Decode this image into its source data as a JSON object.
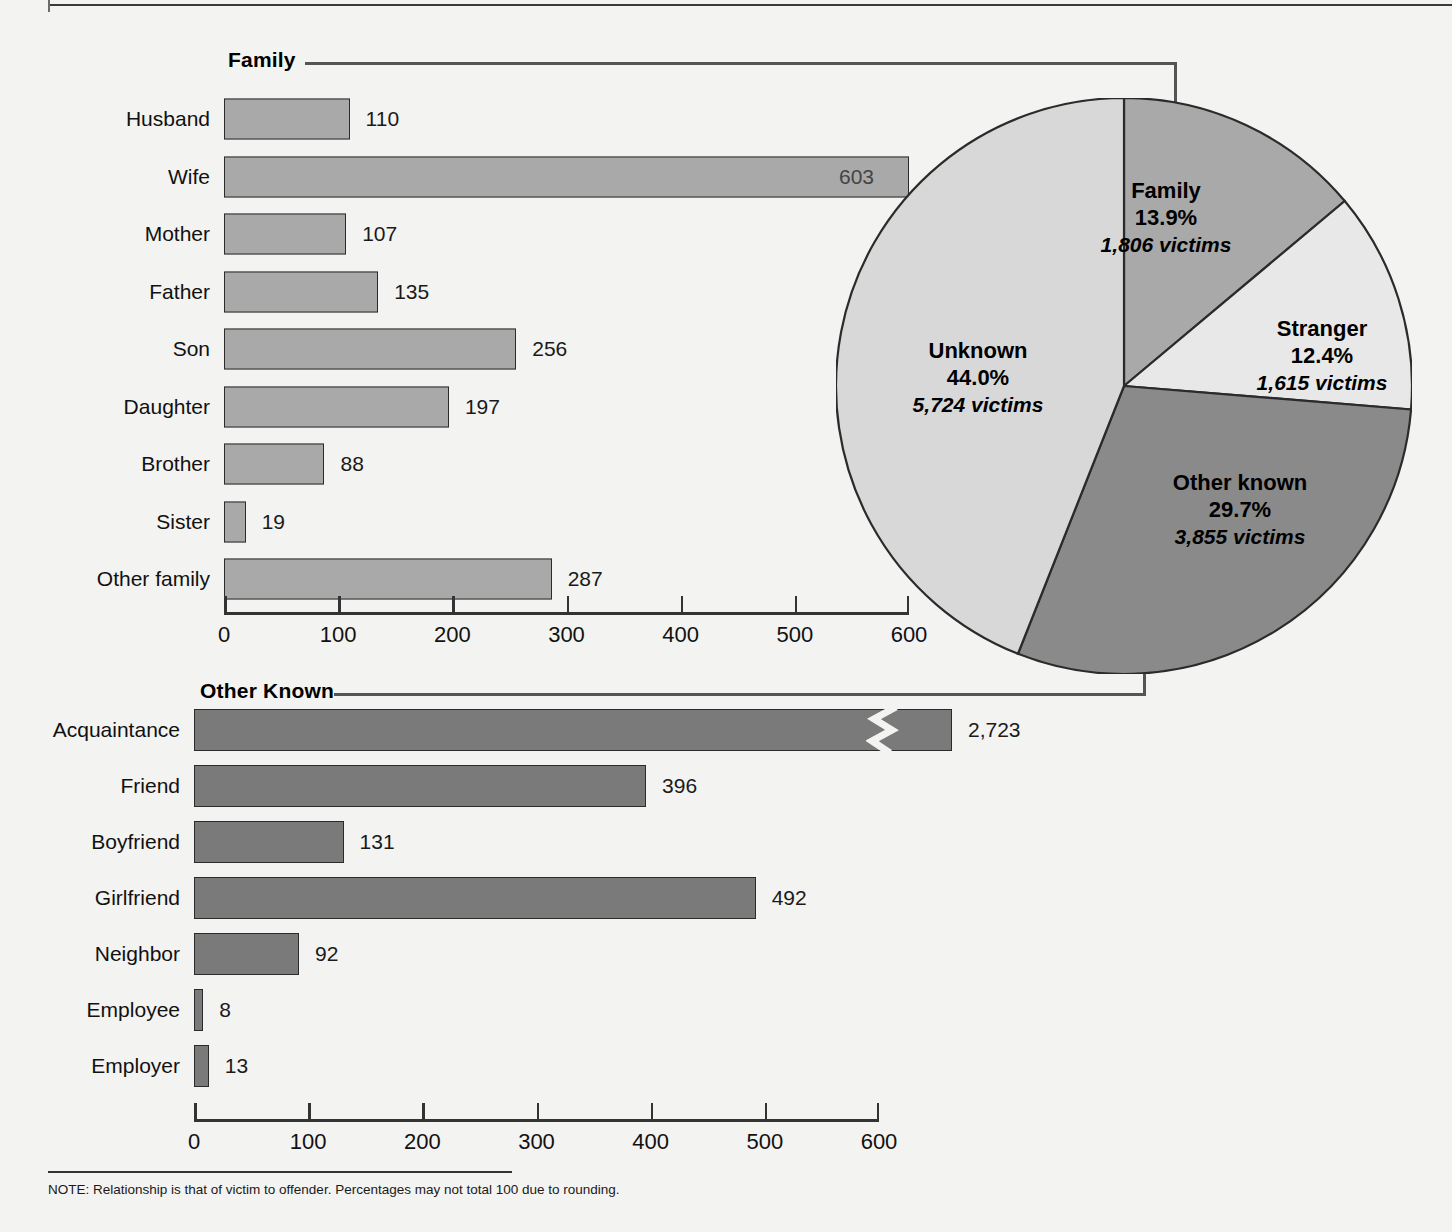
{
  "note": "NOTE: Relationship is that of victim to offender. Percentages may not total 100 due to rounding.",
  "sections": {
    "family_title": "Family",
    "other_known_title": "Other Known"
  },
  "colors": {
    "bar_family": "#a9a9a9",
    "bar_other_known": "#7a7a7a",
    "pie_family": "#a9a9a9",
    "pie_stranger": "#e8e8e8",
    "pie_other_known": "#8a8a8a",
    "pie_unknown": "#d8d8d8",
    "outline": "#2b2b2b",
    "page_bg": "#f3f3f1"
  },
  "chart_data": [
    {
      "type": "bar",
      "title": "Family",
      "orientation": "horizontal",
      "xlabel": "",
      "ylabel": "",
      "xlim": [
        0,
        600
      ],
      "xticks": [
        0,
        100,
        200,
        300,
        400,
        500,
        600
      ],
      "xtick_labels": [
        "0",
        "100",
        "200",
        "300",
        "400",
        "500",
        "600"
      ],
      "grid": false,
      "categories": [
        "Husband",
        "Wife",
        "Mother",
        "Father",
        "Son",
        "Daughter",
        "Brother",
        "Sister",
        "Other family"
      ],
      "values": [
        110,
        603,
        107,
        135,
        256,
        197,
        88,
        19,
        287
      ],
      "value_labels": [
        "110",
        "603",
        "107",
        "135",
        "256",
        "197",
        "88",
        "19",
        "287"
      ],
      "label_inside": [
        false,
        true,
        false,
        false,
        false,
        false,
        false,
        false,
        false
      ]
    },
    {
      "type": "bar",
      "title": "Other Known",
      "orientation": "horizontal",
      "xlabel": "",
      "ylabel": "",
      "xlim": [
        0,
        600
      ],
      "xticks": [
        0,
        100,
        200,
        300,
        400,
        500,
        600
      ],
      "xtick_labels": [
        "0",
        "100",
        "200",
        "300",
        "400",
        "500",
        "600"
      ],
      "grid": false,
      "categories": [
        "Acquaintance",
        "Friend",
        "Boyfriend",
        "Girlfriend",
        "Neighbor",
        "Employee",
        "Employer"
      ],
      "values": [
        2723,
        396,
        131,
        492,
        92,
        8,
        13
      ],
      "value_labels": [
        "2,723",
        "396",
        "131",
        "492",
        "92",
        "8",
        "13"
      ],
      "label_inside": [
        false,
        false,
        false,
        false,
        false,
        false,
        false
      ],
      "broken_axis_bars": [
        "Acquaintance"
      ],
      "note": "Acquaintance bar is truncated with an axis-break zigzag"
    },
    {
      "type": "pie",
      "title": "",
      "legend_position": "inside-slices",
      "slices": [
        {
          "name": "Family",
          "percent": 13.9,
          "victims": 1806,
          "percent_label": "13.9%",
          "victims_label": "1,806 victims",
          "color": "#a9a9a9"
        },
        {
          "name": "Stranger",
          "percent": 12.4,
          "victims": 1615,
          "percent_label": "12.4%",
          "victims_label": "1,615 victims",
          "color": "#e8e8e8"
        },
        {
          "name": "Other known",
          "percent": 29.7,
          "victims": 3855,
          "percent_label": "29.7%",
          "victims_label": "3,855 victims",
          "color": "#8a8a8a"
        },
        {
          "name": "Unknown",
          "percent": 44.0,
          "victims": 5724,
          "percent_label": "44.0%",
          "victims_label": "5,724 victims",
          "color": "#d8d8d8"
        }
      ]
    }
  ]
}
